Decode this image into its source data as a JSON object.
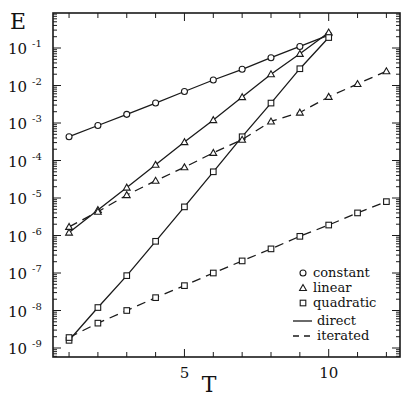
{
  "chart_data": {
    "type": "line",
    "title": "",
    "xlabel": "T",
    "ylabel": "E",
    "x_scale": "linear",
    "y_scale": "log",
    "xlim": [
      0.55,
      12.5
    ],
    "ylim": [
      4e-10,
      0.7
    ],
    "x_ticks": [
      1,
      2,
      3,
      4,
      5,
      6,
      7,
      8,
      9,
      10,
      11,
      12
    ],
    "x_tick_labels": [
      {
        "value": 5,
        "label": "5"
      },
      {
        "value": 10,
        "label": "10"
      }
    ],
    "y_ticks": [
      {
        "exp": -1,
        "label": "10",
        "sup": "-1"
      },
      {
        "exp": -2,
        "label": "10",
        "sup": "-2"
      },
      {
        "exp": -3,
        "label": "10",
        "sup": "-3"
      },
      {
        "exp": -4,
        "label": "10",
        "sup": "-4"
      },
      {
        "exp": -5,
        "label": "10",
        "sup": "-5"
      },
      {
        "exp": -6,
        "label": "10",
        "sup": "-6"
      },
      {
        "exp": -7,
        "label": "10",
        "sup": "-7"
      },
      {
        "exp": -8,
        "label": "10",
        "sup": "-8"
      },
      {
        "exp": -9,
        "label": "10",
        "sup": "-9"
      }
    ],
    "grid": false,
    "legend_position": "lower right",
    "legend": {
      "markers": [
        {
          "marker": "circle",
          "label": "constant"
        },
        {
          "marker": "triangle",
          "label": "linear"
        },
        {
          "marker": "square",
          "label": "quadratic"
        }
      ],
      "lines": [
        {
          "style": "solid",
          "label": "direct"
        },
        {
          "style": "dashed",
          "label": "iterated"
        }
      ]
    },
    "series": [
      {
        "name": "constant, direct",
        "marker": "circle",
        "line": "solid",
        "x": [
          1,
          2,
          3,
          4,
          5,
          6,
          7,
          8,
          9,
          10
        ],
        "values": [
          0.00043,
          0.00086,
          0.0017,
          0.0034,
          0.0069,
          0.014,
          0.027,
          0.055,
          0.11,
          0.22
        ]
      },
      {
        "name": "linear, direct",
        "marker": "triangle",
        "line": "solid",
        "x": [
          1,
          2,
          3,
          4,
          5,
          6,
          7,
          8,
          9,
          10
        ],
        "values": [
          1.2e-06,
          4.8e-06,
          1.9e-05,
          7.7e-05,
          0.00031,
          0.0012,
          0.0049,
          0.02,
          0.07,
          0.26
        ]
      },
      {
        "name": "quadratic, direct",
        "marker": "square",
        "line": "solid",
        "x": [
          1,
          2,
          3,
          4,
          5,
          6,
          7,
          8,
          9,
          10
        ],
        "values": [
          1.6e-09,
          1.2e-08,
          8.5e-08,
          7e-07,
          5.8e-06,
          5e-05,
          0.00043,
          0.0034,
          0.028,
          0.19
        ]
      },
      {
        "name": "linear, iterated",
        "marker": "triangle",
        "line": "dashed",
        "x": [
          1,
          2,
          3,
          4,
          5,
          6,
          7,
          8,
          9,
          10,
          11,
          12
        ],
        "values": [
          1.7e-06,
          4.3e-06,
          1.2e-05,
          2.9e-05,
          6.6e-05,
          0.00016,
          0.00036,
          0.0011,
          0.0019,
          0.005,
          0.011,
          0.024
        ]
      },
      {
        "name": "quadratic, iterated",
        "marker": "square",
        "line": "dashed",
        "x": [
          1,
          2,
          3,
          4,
          5,
          6,
          7,
          8,
          9,
          10,
          11,
          12
        ],
        "values": [
          1.9e-09,
          4.6e-09,
          1e-08,
          2.2e-08,
          4.6e-08,
          1e-07,
          2.1e-07,
          4.4e-07,
          9.5e-07,
          1.9e-06,
          4e-06,
          8e-06
        ]
      }
    ]
  }
}
